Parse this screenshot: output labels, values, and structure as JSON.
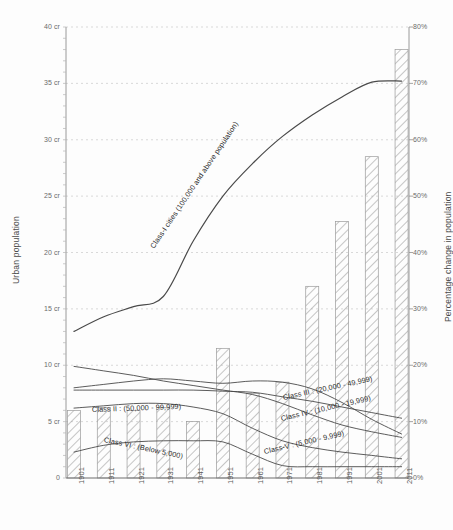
{
  "chart_data": {
    "type": "line",
    "title": "",
    "xlabel": "",
    "ylabel": "Urban population",
    "y2label": "Percentage change in population",
    "x": [
      "1901",
      "1911",
      "1921",
      "1931",
      "1941",
      "1951",
      "1961",
      "1971",
      "1981",
      "1991",
      "2001",
      "2011"
    ],
    "ylim": [
      0,
      40
    ],
    "y2lim": [
      0,
      80
    ],
    "yticks": [
      "0",
      "5 cr",
      "10 cr",
      "15 cr",
      "20 cr",
      "25 cr",
      "30 cr",
      "35 cr",
      "40 cr"
    ],
    "y2ticks": [
      "0%",
      "10%",
      "20%",
      "30%",
      "40%",
      "50%",
      "60%",
      "70%",
      "80%"
    ],
    "grid": true,
    "legend_position": "inline-along-curves",
    "series": [
      {
        "name": "Class-I cities (100,000 and above population)",
        "label": "Class-I cities (100,000 and above population)",
        "kind": "line",
        "axis": "left",
        "values": [
          13.0,
          14.3,
          15.2,
          16.1,
          21.0,
          25.0,
          27.9,
          30.3,
          32.2,
          33.8,
          35.1,
          35.2
        ]
      },
      {
        "name": "Class II : (50,000 - 99,999)",
        "label": "Class II : (50,000 - 99,999)",
        "kind": "line",
        "axis": "left",
        "values": [
          9.9,
          9.5,
          9.1,
          8.6,
          8.2,
          7.8,
          7.4,
          6.6,
          5.6,
          4.7,
          4.1,
          3.6
        ]
      },
      {
        "name": "Class III : (20,000 - 49,999)",
        "label": "Class III : (20,000 - 49,999)",
        "kind": "line",
        "axis": "left",
        "values": [
          7.8,
          7.8,
          7.8,
          7.8,
          7.8,
          7.7,
          7.6,
          7.2,
          6.8,
          6.3,
          5.8,
          5.3
        ]
      },
      {
        "name": "Class IV : (10,000 - 19,999)",
        "label": "Class IV : (10,000 - 19,999)",
        "kind": "line",
        "axis": "left",
        "values": [
          8.0,
          8.3,
          8.6,
          8.8,
          8.6,
          8.4,
          8.6,
          8.5,
          7.9,
          6.7,
          5.2,
          3.9
        ]
      },
      {
        "name": "Class-V : (5,000 - 9,999)",
        "label": "Class-V : (5,000 - 9,999)",
        "kind": "line",
        "axis": "left",
        "values": [
          6.2,
          6.4,
          6.6,
          6.6,
          6.3,
          5.7,
          4.4,
          3.3,
          2.7,
          2.3,
          2.0,
          1.7
        ]
      },
      {
        "name": "Class VI : (Below 5,000)",
        "label": "Class VI : (Below 5,000)",
        "kind": "line",
        "axis": "left",
        "values": [
          2.3,
          2.9,
          3.2,
          3.3,
          3.3,
          3.2,
          2.1,
          1.1,
          1.0,
          1.0,
          1.0,
          1.0
        ]
      },
      {
        "name": "Percentage change in population",
        "label": "Percentage change in population",
        "kind": "bar",
        "axis": "right",
        "values": [
          12.0,
          12.5,
          12.0,
          12.5,
          10.0,
          23.0,
          15.0,
          17.0,
          34.0,
          45.5,
          57.0,
          76.0
        ]
      }
    ]
  }
}
